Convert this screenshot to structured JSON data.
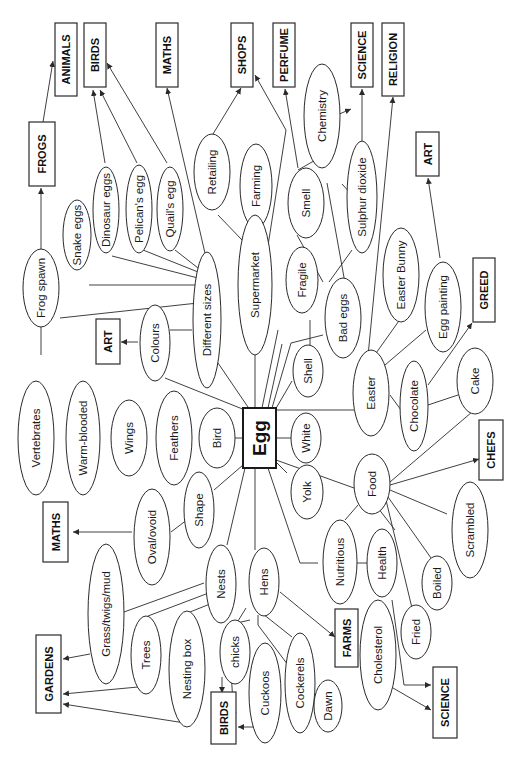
{
  "diagram": {
    "type": "mind-map",
    "orientation": "rotated-90-ccw",
    "center": {
      "id": "egg",
      "label": "Egg"
    },
    "nodes": {
      "different_sizes": "Different sizes",
      "frog_spawn": "Frog spawn",
      "snake_eggs": "Snake eggs",
      "dinosaur_eggs": "Dinosaur eggs",
      "pelicans_egg": "Pelican's egg",
      "quails_egg": "Quail's egg",
      "colours": "Colours",
      "supermarket": "Supermarket",
      "retailing": "Retailing",
      "farming": "Farming",
      "fragile": "Fragile",
      "shell": "Shell",
      "bad_eggs": "Bad eggs",
      "smell": "Smell",
      "chemistry": "Chemistry",
      "sulphur_dioxide": "Sulphur dioxide",
      "easter": "Easter",
      "easter_bunny": "Easter Bunny",
      "egg_painting": "Egg painting",
      "chocolate": "Chocolate",
      "cake": "Cake",
      "white": "White",
      "yolk": "Yolk",
      "food": "Food",
      "scrambled": "Scrambled",
      "boiled": "Boiled",
      "fried": "Fried",
      "nutritious": "Nutritious",
      "health": "Health",
      "cholesterol": "Cholesterol",
      "bird": "Bird",
      "feathers": "Feathers",
      "wings": "Wings",
      "warm_blooded": "Warm-blooded",
      "vertebrates": "Vertebrates",
      "shape": "Shape",
      "oval_ovoid": "Oval/ovoid",
      "nests": "Nests",
      "grass_twigs_mud": "Grass/twigs/mud",
      "trees": "Trees",
      "nesting_box": "Nesting box",
      "hens": "Hens",
      "chicks": "chicks",
      "cuckoos": "Cuckoos",
      "cockerels": "Cockerels",
      "dawn": "Dawn"
    },
    "subjects": {
      "animals": "ANIMALS",
      "frogs": "FROGS",
      "birds_top": "BIRDS",
      "maths_top": "MATHS",
      "shops": "SHOPS",
      "perfume": "PERFUME",
      "science_top": "SCIENCE",
      "religion": "RELIGION",
      "art_right": "ART",
      "art_left": "ART",
      "greed": "GREED",
      "chefs": "CHEFS",
      "maths_bottom": "MATHS",
      "gardens": "GARDENS",
      "birds_bottom": "BIRDS",
      "farms": "FARMS",
      "science_bottom": "SCIENCE"
    },
    "colors": {
      "stroke": "#2a2a2a",
      "background": "#ffffff",
      "text": "#1a1a1a"
    }
  }
}
